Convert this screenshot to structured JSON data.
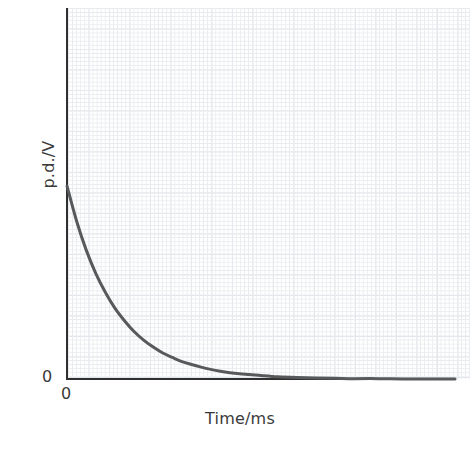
{
  "chart_data": {
    "type": "line",
    "title": "",
    "subtitle": "",
    "xlabel": "Time/ms",
    "ylabel": "p.d./V",
    "x_origin_label": "0",
    "y_origin_label": "0",
    "grid": true,
    "grid_style": "graph-paper (fine minor squares with bold major squares)",
    "legend": null,
    "legend_position": "none",
    "xlim": [
      0,
      8.1
    ],
    "ylim": [
      0,
      1.0
    ],
    "x_tick_labels": [
      "0"
    ],
    "y_tick_labels": [
      "0"
    ],
    "annotations": [],
    "series": [
      {
        "name": "p.d. decay",
        "color": "#58595b",
        "model": "V = V0 * exp(-t / tau)",
        "V0": 0.52,
        "tau": 1.0,
        "x": [
          0.0,
          0.2,
          0.4,
          0.6,
          0.8,
          1.0,
          1.2,
          1.4,
          1.6,
          1.8,
          2.0,
          2.2,
          2.4,
          2.6,
          2.8,
          3.0,
          3.2,
          3.4,
          3.6,
          3.8,
          4.0,
          4.4,
          4.8,
          5.2,
          5.6,
          6.0,
          6.5,
          7.0,
          7.5,
          8.1
        ],
        "values": [
          0.52,
          0.426,
          0.348,
          0.285,
          0.234,
          0.191,
          0.157,
          0.128,
          0.105,
          0.086,
          0.07,
          0.058,
          0.047,
          0.039,
          0.032,
          0.026,
          0.021,
          0.017,
          0.014,
          0.012,
          0.01,
          0.006,
          0.004,
          0.003,
          0.002,
          0.001,
          0.001,
          0.0,
          0.0,
          0.0
        ]
      }
    ]
  },
  "axes": {
    "y_axis_name": "p.d. axis",
    "x_axis_name": "Time axis"
  }
}
